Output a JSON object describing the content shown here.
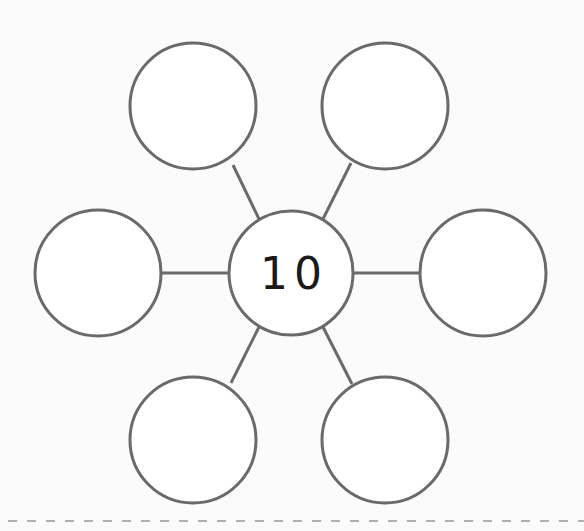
{
  "diagram": {
    "type": "number-bond-web",
    "center": {
      "label": "10",
      "cx": 291,
      "cy": 273,
      "r": 62
    },
    "outer_nodes": [
      {
        "position": "top-left",
        "label": "",
        "cx": 193,
        "cy": 106,
        "r": 63
      },
      {
        "position": "top-right",
        "label": "",
        "cx": 385,
        "cy": 106,
        "r": 63
      },
      {
        "position": "left",
        "label": "",
        "cx": 98,
        "cy": 273,
        "r": 63
      },
      {
        "position": "right",
        "label": "",
        "cx": 483,
        "cy": 273,
        "r": 63
      },
      {
        "position": "bottom-left",
        "label": "",
        "cx": 193,
        "cy": 440,
        "r": 63
      },
      {
        "position": "bottom-right",
        "label": "",
        "cx": 385,
        "cy": 440,
        "r": 63
      }
    ],
    "colors": {
      "stroke": "#6a6a6a",
      "fill": "#ffffff",
      "text": "#1a1a1a",
      "background": "#fbfbfb",
      "divider": "#b0b0b0"
    }
  }
}
